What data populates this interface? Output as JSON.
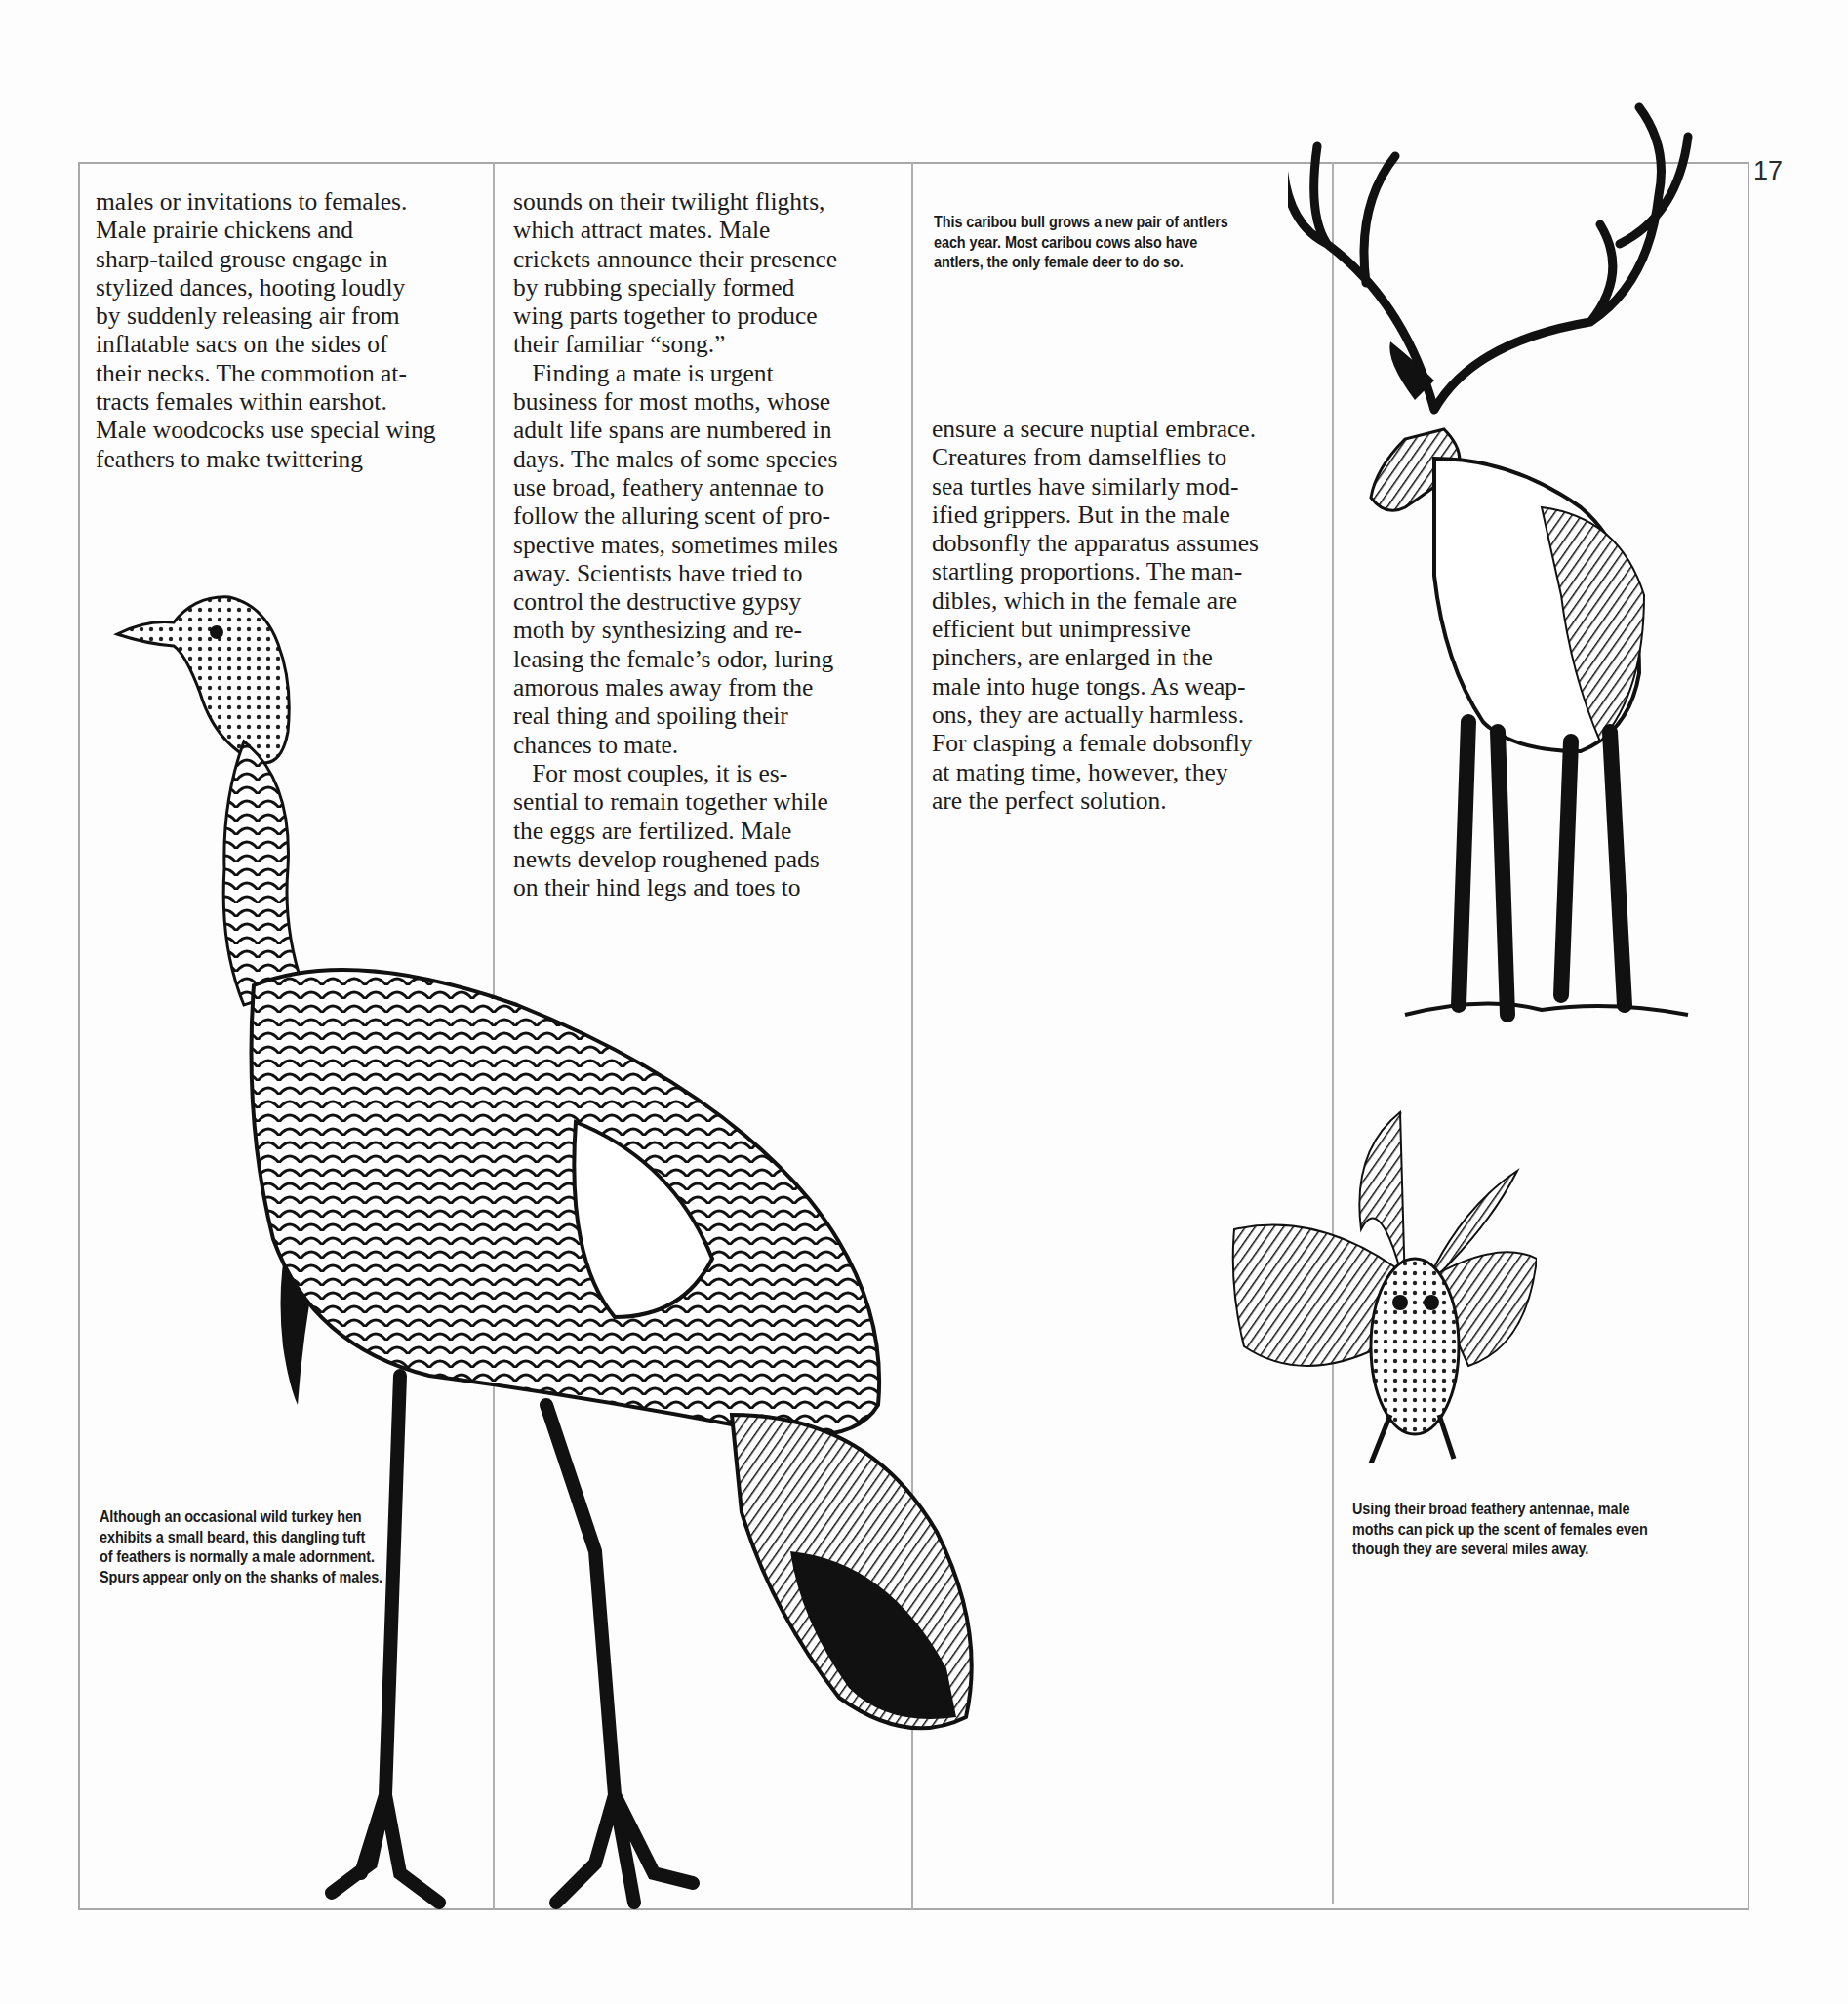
{
  "page": {
    "page_number": "17",
    "column_1": {
      "text": "males or invitations to females.\nMale prairie chickens and\nsharp-tailed grouse engage in\nstylized dances, hooting loudly\nby suddenly releasing air from\ninflatable sacs on the sides of\ntheir necks. The commotion at-\ntracts females within earshot.\nMale woodcocks use special wing\nfeathers to make twittering"
    },
    "column_2": {
      "text": "sounds on their twilight flights,\nwhich attract mates. Male\ncrickets announce their presence\nby rubbing specially formed\nwing parts together to produce\ntheir familiar “song.”\n   Finding a mate is urgent\nbusiness for most moths, whose\nadult life spans are numbered in\ndays. The males of some species\nuse broad, feathery antennae to\nfollow the alluring scent of pro-\nspective mates, sometimes miles\naway. Scientists have tried to\ncontrol the destructive gypsy\nmoth by synthesizing and re-\nleasing the female’s odor, luring\namorous males away from the\nreal thing and spoiling their\nchances to mate.\n   For most couples, it is es-\nsential to remain together while\nthe eggs are fertilized. Male\nnewts develop roughened pads\non their hind legs and toes to"
    },
    "column_3": {
      "text": "ensure a secure nuptial embrace.\nCreatures from damselflies to\nsea turtles have similarly mod-\nified grippers. But in the male\ndobsonfly the apparatus assumes\nstartling proportions. The man-\ndibles, which in the female are\nefficient but unimpressive\npinchers, are enlarged in the\nmale into huge tongs. As weap-\nons, they are actually harmless.\nFor clasping a female dobsonfly\nat mating time, however, they\nare the perfect solution."
    },
    "captions": {
      "caribou": "This caribou bull grows a new pair of antlers\neach year. Most caribou cows also have\nantlers, the only female deer to do so.",
      "turkey": "Although an occasional wild turkey hen\nexhibits a small beard, this dangling tuft\nof feathers is normally a male adornment.\nSpurs appear only on the shanks of males.",
      "moth": "Using their broad feathery antennae, male\nmoths can pick up the scent of females even\nthough they are several miles away."
    },
    "illustrations": [
      "wild turkey",
      "caribou bull",
      "male moth"
    ]
  }
}
